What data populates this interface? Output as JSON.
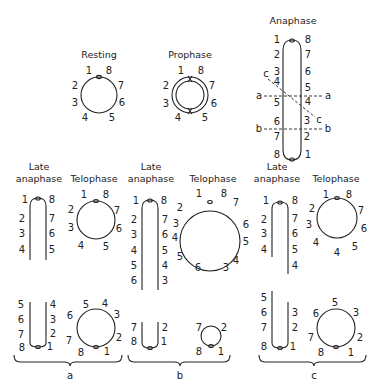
{
  "titles": {
    "resting": "Resting",
    "prophase": "Prophase",
    "anaphase": "Anaphase",
    "late_anaphase_1": "Late",
    "late_anaphase_2": "anaphase",
    "telophase": "Telophase"
  },
  "resting": {
    "labels": [
      "1",
      "8",
      "2",
      "7",
      "3",
      "6",
      "4",
      "5"
    ]
  },
  "prophase": {
    "labels": [
      "1",
      "8",
      "2",
      "7",
      "3",
      "6",
      "4",
      "5"
    ]
  },
  "anaphase": {
    "left": [
      "1",
      "2",
      "3",
      "4",
      "5",
      "6",
      "7",
      "8"
    ],
    "right": [
      "8",
      "7",
      "6",
      "5",
      "4",
      "3",
      "2",
      "1"
    ],
    "cuts": [
      "a",
      "a",
      "b",
      "b",
      "c",
      "c"
    ]
  },
  "panel_a": {
    "late_top_left": [
      "1",
      "2",
      "3",
      "4"
    ],
    "late_top_right": [
      "8",
      "7",
      "6",
      "5"
    ],
    "late_bottom_left": [
      "5",
      "6",
      "7",
      "8"
    ],
    "late_bottom_right": [
      "4",
      "3",
      "2",
      "1"
    ],
    "telo_top": [
      "1",
      "8",
      "7",
      "6",
      "5",
      "4",
      "3",
      "2"
    ],
    "telo_bottom": [
      "5",
      "4",
      "3",
      "2",
      "1",
      "8",
      "7",
      "6"
    ],
    "label": "a"
  },
  "panel_b": {
    "late_top_left": [
      "1",
      "2",
      "3",
      "4",
      "5",
      "6"
    ],
    "late_top_right": [
      "8",
      "7",
      "6",
      "5",
      "4",
      "3"
    ],
    "late_bottom_left": [
      "7",
      "8"
    ],
    "late_bottom_right": [
      "2",
      "1"
    ],
    "telo_top": [
      "1",
      "8",
      "7",
      "6",
      "5",
      "4",
      "3",
      "6",
      "5",
      "4",
      "3",
      "2"
    ],
    "telo_bottom": [
      "7",
      "2",
      "1",
      "8"
    ],
    "label": "b"
  },
  "panel_c": {
    "late_top_left": [
      "1",
      "2",
      "3",
      "4"
    ],
    "late_top_right": [
      "8",
      "7",
      "6",
      "5",
      "4"
    ],
    "late_bottom_left": [
      "5",
      "6",
      "7",
      "8"
    ],
    "late_bottom_right": [
      "3",
      "2",
      "1"
    ],
    "telo_top": [
      "1",
      "8",
      "7",
      "6",
      "5",
      "4",
      "4",
      "3",
      "2"
    ],
    "telo_bottom": [
      "5",
      "3",
      "2",
      "1",
      "8",
      "7",
      "6"
    ],
    "label": "c"
  }
}
